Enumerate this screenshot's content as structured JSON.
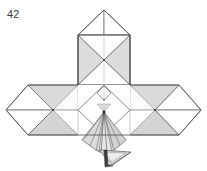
{
  "figure": {
    "step_label": "42",
    "caption": "",
    "title": "Origami folding diagram step 42",
    "background_color": "#ffffff"
  },
  "palette": {
    "paper_front": "#ffffff",
    "paper_back_light": "#e4e4e4",
    "paper_back_mid": "#d9d9d9",
    "paper_back_dark": "#cfcfcf",
    "paper_shadow": "#bfbfbf",
    "crease_line": "#585858",
    "crease_line_light": "#9a9a9a",
    "crease_line_faint": "#c3c3c3",
    "outline": "#4a4a4a",
    "vertex_dot": "#2b2b2b"
  },
  "geometry": {
    "canvas": {
      "width": 207,
      "height": 171
    },
    "anchors": {
      "top_apex": [
        104,
        10
      ],
      "top_left_shoulder": [
        78,
        35
      ],
      "top_right_shoulder": [
        130,
        35
      ],
      "top_block_left_bottom": [
        78,
        85
      ],
      "top_block_right_bottom": [
        130,
        85
      ],
      "top_block_center": [
        104,
        60
      ],
      "band_top_y": 85,
      "band_mid_y": 110,
      "band_bottom_y": 135,
      "left_wing_tip": [
        6,
        110
      ],
      "right_wing_tip": [
        201,
        110
      ],
      "left_node": [
        53,
        110
      ],
      "right_node": [
        155,
        110
      ],
      "center_node": [
        104,
        110
      ],
      "center_notch": [
        104,
        92
      ],
      "beak_apex": [
        104,
        112
      ],
      "beak_bottom": [
        112,
        162
      ],
      "flap_tip": [
        122,
        156
      ]
    }
  },
  "shapes": {
    "top_roof": {
      "name": "top-roof-peak",
      "description": "peak triangle above upper block"
    },
    "top_block": {
      "name": "upper-block",
      "description": "rectangle with X diagonals, shaded side triangles"
    },
    "middle_band": {
      "name": "wing-band",
      "description": "horizontal band of diamonds forming the wings"
    },
    "beak": {
      "name": "center-beak",
      "description": "fan-folded pointed flap at the center bottom"
    }
  }
}
